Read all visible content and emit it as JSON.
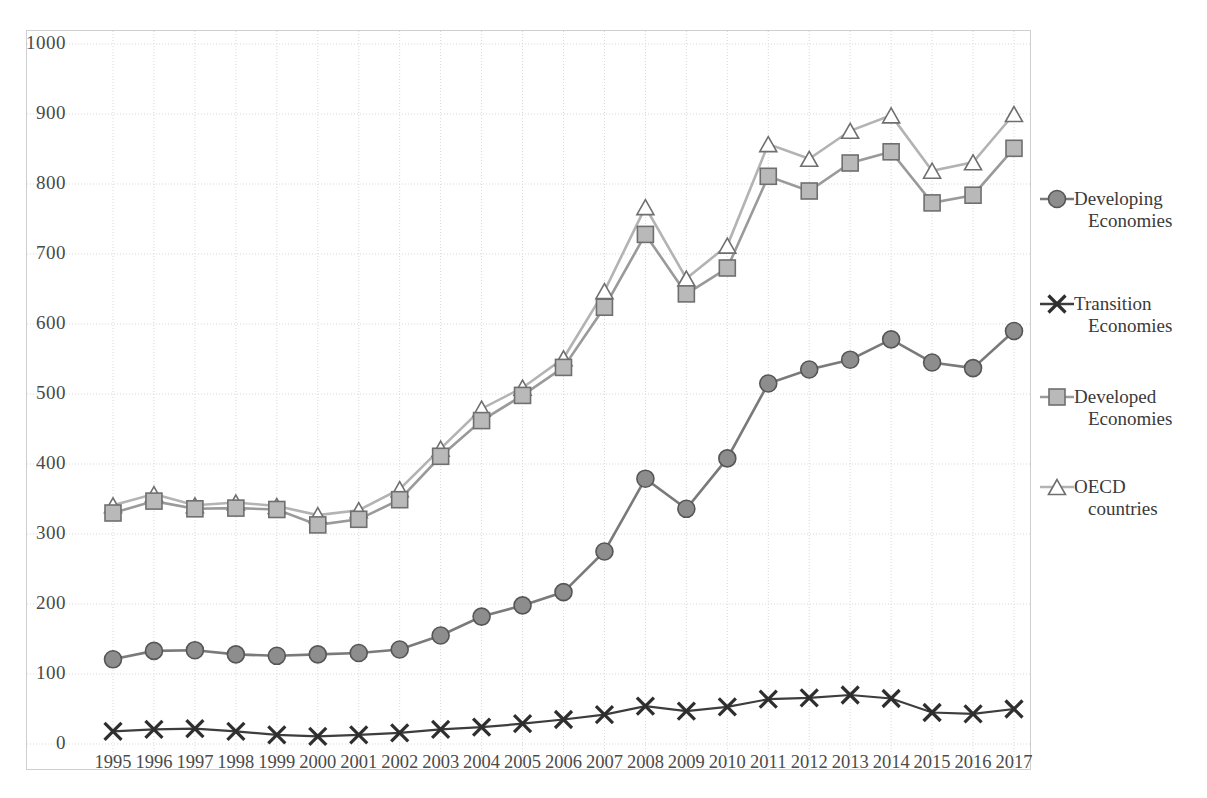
{
  "chart_data": {
    "type": "line",
    "title": "",
    "subtitle": "",
    "xlabel": "",
    "ylabel": "",
    "grid": true,
    "legend_position": "right",
    "ylim": [
      0,
      1000
    ],
    "yticks": [
      0,
      100,
      200,
      300,
      400,
      500,
      600,
      700,
      800,
      900,
      1000
    ],
    "ytick_labels": [
      "0",
      "100",
      "200",
      "300",
      "400",
      "500",
      "600",
      "700",
      "800",
      "900",
      "1000"
    ],
    "categories": [
      "1995",
      "1996",
      "1997",
      "1998",
      "1999",
      "2000",
      "2001",
      "2002",
      "2003",
      "2004",
      "2005",
      "2006",
      "2007",
      "2008",
      "2009",
      "2010",
      "2011",
      "2012",
      "2013",
      "2014",
      "2015",
      "2016",
      "2017"
    ],
    "series": [
      {
        "name": "Developing Economies",
        "marker": "circle",
        "color": "#7a7a7a",
        "values": [
          121,
          133,
          134,
          128,
          126,
          128,
          130,
          135,
          155,
          182,
          198,
          217,
          275,
          379,
          336,
          408,
          515,
          535,
          549,
          578,
          545,
          537,
          590
        ]
      },
      {
        "name": "Transition Economies",
        "marker": "x",
        "color": "#3d3d3d",
        "values": [
          18,
          21,
          22,
          18,
          13,
          11,
          13,
          16,
          21,
          24,
          29,
          35,
          42,
          54,
          47,
          53,
          64,
          66,
          70,
          65,
          45,
          43,
          50
        ]
      },
      {
        "name": "Developed Economies",
        "marker": "square",
        "color": "#9a9a9a",
        "values": [
          330,
          347,
          336,
          337,
          335,
          313,
          321,
          349,
          411,
          462,
          498,
          538,
          624,
          728,
          643,
          680,
          811,
          790,
          830,
          846,
          773,
          784,
          851
        ]
      },
      {
        "name": "OECD countries",
        "marker": "triangle",
        "color": "#b3b3b3",
        "values": [
          341,
          357,
          341,
          345,
          340,
          327,
          334,
          364,
          422,
          479,
          509,
          551,
          647,
          767,
          665,
          712,
          857,
          836,
          876,
          898,
          819,
          831,
          900
        ]
      }
    ]
  },
  "legend": {
    "items": [
      {
        "label_line1": "Developing",
        "label_line2": "Economies",
        "marker": "circle"
      },
      {
        "label_line1": "Transition",
        "label_line2": "Economies",
        "marker": "x"
      },
      {
        "label_line1": "Developed",
        "label_line2": "Economies",
        "marker": "square"
      },
      {
        "label_line1": "OECD",
        "label_line2": "countries",
        "marker": "triangle"
      }
    ]
  },
  "colors": {
    "developing": "#7a7a7a",
    "transition": "#3d3d3d",
    "developed": "#9a9a9a",
    "oecd": "#b3b3b3",
    "grid": "#d9d9d9",
    "border": "#cfcfcf",
    "text": "#4a4a4a",
    "background": "#ffffff"
  }
}
